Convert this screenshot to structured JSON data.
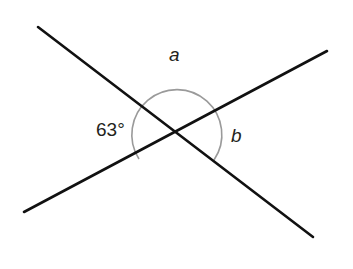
{
  "diagram": {
    "type": "intersecting-lines-angles",
    "lines": [
      {
        "id": "line-1",
        "from": [
          38,
          27
        ],
        "to": [
          313,
          237
        ]
      },
      {
        "id": "line-2",
        "from": [
          24,
          212
        ],
        "to": [
          327,
          51
        ]
      }
    ],
    "intersection": [
      176,
      132
    ],
    "labels": {
      "angle_given": "63°",
      "angle_a": "a",
      "angle_b": "b"
    },
    "colors": {
      "line": "#111111",
      "arc": "#9a9a9a",
      "text": "#231f20"
    }
  }
}
